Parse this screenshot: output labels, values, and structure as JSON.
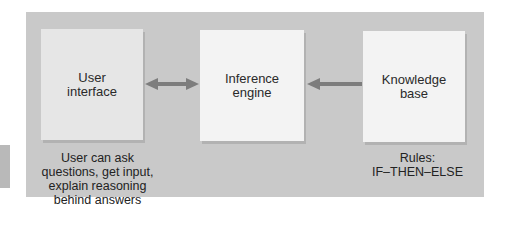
{
  "diagram": {
    "title": "",
    "panel_color": "#c9c9c9",
    "arrow_color": "#7d7d7d",
    "components": [
      {
        "id": "user-interface",
        "label": "User\ninterface"
      },
      {
        "id": "inference-engine",
        "label": "Inference\nengine"
      },
      {
        "id": "knowledge-base",
        "label": "Knowledge\nbase"
      }
    ],
    "connections": [
      {
        "from": "user-interface",
        "to": "inference-engine",
        "direction": "bidirectional"
      },
      {
        "from": "knowledge-base",
        "to": "inference-engine",
        "direction": "one-way"
      }
    ],
    "captions": {
      "user_interface": "User can ask\nquestions, get input,\nexplain reasoning\nbehind answers",
      "knowledge_base": "Rules:\nIF–THEN–ELSE"
    }
  }
}
